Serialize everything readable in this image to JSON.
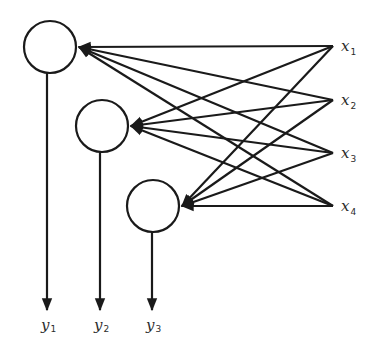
{
  "diagram": {
    "type": "single-layer neural network",
    "colors": {
      "stroke": "#1a1a1a",
      "background": "#ffffff",
      "text": "#2b2b2b"
    },
    "inputs": [
      {
        "id": "x1",
        "label": "x",
        "sub": "1",
        "x": 333,
        "y": 46
      },
      {
        "id": "x2",
        "label": "x",
        "sub": "2",
        "x": 333,
        "y": 100
      },
      {
        "id": "x3",
        "label": "x",
        "sub": "3",
        "x": 333,
        "y": 153
      },
      {
        "id": "x4",
        "label": "x",
        "sub": "4",
        "x": 333,
        "y": 206
      }
    ],
    "neurons": [
      {
        "id": "n1",
        "cx": 50,
        "cy": 47,
        "r": 26
      },
      {
        "id": "n2",
        "cx": 102,
        "cy": 126,
        "r": 26
      },
      {
        "id": "n3",
        "cx": 153,
        "cy": 206,
        "r": 26
      }
    ],
    "outputs": [
      {
        "id": "y1",
        "label": "y",
        "sub": "1",
        "x": 47
      },
      {
        "id": "y2",
        "label": "y",
        "sub": "2",
        "x": 100
      },
      {
        "id": "y3",
        "label": "y",
        "sub": "3",
        "x": 152
      }
    ],
    "edges": "every input connects to every neuron (4 x 3 = 12 directed arrows)"
  }
}
